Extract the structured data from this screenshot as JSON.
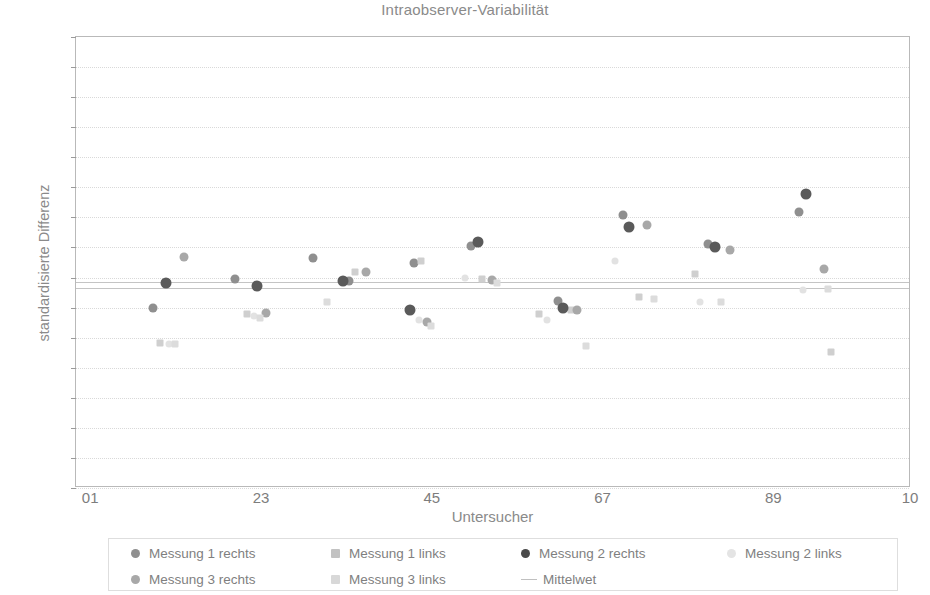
{
  "chart_data": {
    "type": "scatter",
    "title": "Intraobserver-Variabilität",
    "xlabel": "Untersucher",
    "ylabel": "standardisierte Differenz",
    "xlim": [
      0,
      11
    ],
    "ylim": [
      -0.5,
      1.0
    ],
    "grid": true,
    "legend_position": "bottom",
    "y_ticks": [
      "1,0",
      "0,9",
      "0,8",
      "0,7",
      "0,6",
      "0,5",
      "0,4",
      "0,3",
      "0,2",
      "0,1",
      "0,0",
      "-0,1",
      "-0,2",
      "-0,3",
      "-0,4",
      "-0,5"
    ],
    "y_tick_values": [
      1.0,
      0.9,
      0.8,
      0.7,
      0.6,
      0.5,
      0.4,
      0.3,
      0.2,
      0.1,
      0.0,
      -0.1,
      -0.2,
      -0.3,
      -0.4,
      -0.5
    ],
    "x_ticks": [
      "01",
      "23",
      "45",
      "67",
      "89",
      "10"
    ],
    "x_tick_values": [
      0.2,
      2.45,
      4.7,
      6.95,
      9.2,
      11.0
    ],
    "mean_lines": [
      0.185,
      0.165
    ],
    "series": [
      {
        "name": "Messung 1 rechts",
        "color": "#8f8f8f",
        "marker": "circle",
        "size": 9,
        "points": [
          {
            "x": 1.02,
            "y": 0.1
          },
          {
            "x": 2.1,
            "y": 0.195
          },
          {
            "x": 3.12,
            "y": 0.265
          },
          {
            "x": 3.6,
            "y": 0.19
          },
          {
            "x": 4.45,
            "y": 0.25
          },
          {
            "x": 5.2,
            "y": 0.305
          },
          {
            "x": 6.35,
            "y": 0.122
          },
          {
            "x": 7.2,
            "y": 0.407
          },
          {
            "x": 8.32,
            "y": 0.312
          },
          {
            "x": 9.52,
            "y": 0.418
          }
        ]
      },
      {
        "name": "Messung 1 links",
        "color": "#cfcfcf",
        "marker": "square",
        "size": 7,
        "points": [
          {
            "x": 1.1,
            "y": -0.018
          },
          {
            "x": 2.25,
            "y": 0.08
          },
          {
            "x": 3.68,
            "y": 0.218
          },
          {
            "x": 4.55,
            "y": 0.255
          },
          {
            "x": 5.35,
            "y": 0.195
          },
          {
            "x": 6.1,
            "y": 0.078
          },
          {
            "x": 6.52,
            "y": 0.092
          },
          {
            "x": 7.42,
            "y": 0.135
          },
          {
            "x": 8.15,
            "y": 0.212
          },
          {
            "x": 9.95,
            "y": -0.048
          }
        ]
      },
      {
        "name": "Messung 2 rechts",
        "color": "#5a5a5a",
        "marker": "circle",
        "size": 11,
        "points": [
          {
            "x": 1.18,
            "y": 0.182
          },
          {
            "x": 2.38,
            "y": 0.172
          },
          {
            "x": 3.52,
            "y": 0.188
          },
          {
            "x": 4.4,
            "y": 0.092
          },
          {
            "x": 5.3,
            "y": 0.318
          },
          {
            "x": 6.42,
            "y": 0.098
          },
          {
            "x": 7.28,
            "y": 0.368
          },
          {
            "x": 8.42,
            "y": 0.302
          },
          {
            "x": 9.62,
            "y": 0.478
          }
        ]
      },
      {
        "name": "Messung 2 links",
        "color": "#e2e2e2",
        "marker": "circle",
        "size": 7,
        "points": [
          {
            "x": 1.22,
            "y": -0.02
          },
          {
            "x": 2.34,
            "y": 0.072
          },
          {
            "x": 4.52,
            "y": 0.06
          },
          {
            "x": 5.12,
            "y": 0.2
          },
          {
            "x": 6.2,
            "y": 0.06
          },
          {
            "x": 7.1,
            "y": 0.255
          },
          {
            "x": 8.22,
            "y": 0.118
          },
          {
            "x": 9.58,
            "y": 0.158
          }
        ]
      },
      {
        "name": "Messung 3 rechts",
        "color": "#a8a8a8",
        "marker": "circle",
        "size": 9,
        "points": [
          {
            "x": 1.42,
            "y": 0.268
          },
          {
            "x": 2.5,
            "y": 0.082
          },
          {
            "x": 3.82,
            "y": 0.218
          },
          {
            "x": 4.62,
            "y": 0.052
          },
          {
            "x": 5.48,
            "y": 0.192
          },
          {
            "x": 6.6,
            "y": 0.092
          },
          {
            "x": 7.52,
            "y": 0.375
          },
          {
            "x": 8.62,
            "y": 0.292
          },
          {
            "x": 9.85,
            "y": 0.228
          }
        ]
      },
      {
        "name": "Messung 3 links",
        "color": "#dcdcdc",
        "marker": "square",
        "size": 7,
        "points": [
          {
            "x": 1.3,
            "y": -0.022
          },
          {
            "x": 2.42,
            "y": 0.066
          },
          {
            "x": 3.3,
            "y": 0.118
          },
          {
            "x": 4.68,
            "y": 0.038
          },
          {
            "x": 5.55,
            "y": 0.182
          },
          {
            "x": 6.72,
            "y": -0.028
          },
          {
            "x": 7.62,
            "y": 0.128
          },
          {
            "x": 8.5,
            "y": 0.118
          },
          {
            "x": 9.9,
            "y": 0.162
          }
        ]
      },
      {
        "name": "Mittelwet",
        "color": "#c0c0c0",
        "marker": "line",
        "size": 0,
        "points": []
      }
    ]
  },
  "legend": {
    "rows": [
      [
        {
          "label": "Messung 1 rechts",
          "color": "#8f8f8f",
          "marker": "circle",
          "x": 22
        },
        {
          "label": "Messung 1 links",
          "color": "#c2c2c2",
          "marker": "square",
          "x": 222
        },
        {
          "label": "Messung 2 rechts",
          "color": "#4a4a4a",
          "marker": "circle",
          "x": 412
        },
        {
          "label": "Messung 2 links",
          "color": "#e4e4e4",
          "marker": "circle",
          "x": 618
        }
      ],
      [
        {
          "label": "Messung 3 rechts",
          "color": "#a8a8a8",
          "marker": "circle",
          "x": 22
        },
        {
          "label": "Messung 3 links",
          "color": "#d8d8d8",
          "marker": "square",
          "x": 222
        },
        {
          "label": "Mittelwet",
          "color": "#c0c0c0",
          "marker": "line",
          "x": 412
        }
      ]
    ]
  }
}
